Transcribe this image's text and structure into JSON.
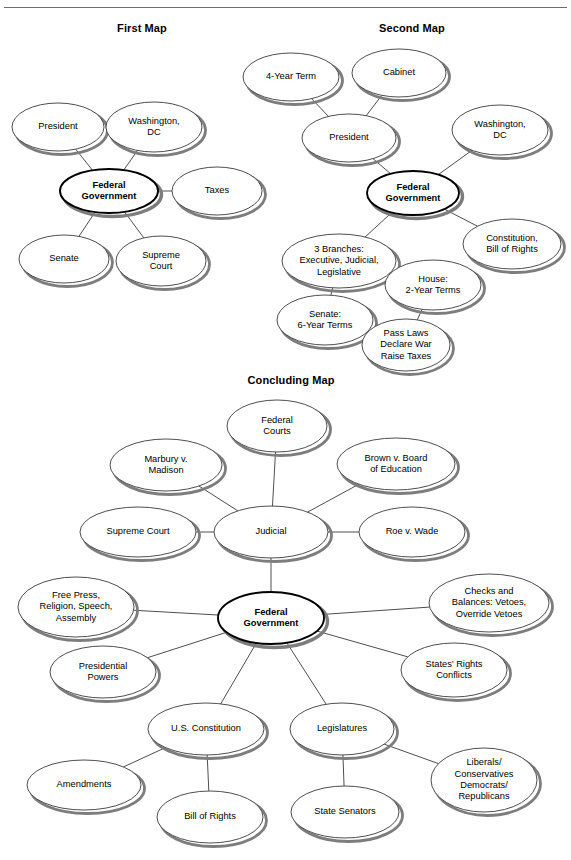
{
  "page": {
    "background": "#ffffff",
    "edge_color": "#3a3a3a",
    "node_fill": "#ffffff",
    "node_stroke": "#3a3a3a",
    "center_node_stroke": "#000000",
    "shadow_color": "#7d7d7d",
    "clipped_top_text": "",
    "titles": [
      {
        "id": "first-map-title",
        "label": "First Map",
        "x": 82,
        "y": 22,
        "w": 120
      },
      {
        "id": "second-map-title",
        "label": "Second Map",
        "x": 352,
        "y": 22,
        "w": 120
      },
      {
        "id": "concluding-map-title",
        "label": "Concluding Map",
        "x": 226,
        "y": 374,
        "w": 130
      }
    ]
  },
  "chart_data": {
    "type": "diagram",
    "maps": [
      {
        "name": "First Map",
        "nodes": [
          {
            "id": "fm-federal",
            "label": "Federal\nGovernment",
            "center": true
          },
          {
            "id": "fm-president",
            "label": "President",
            "center": false
          },
          {
            "id": "fm-washington",
            "label": "Washington,\nDC",
            "center": false
          },
          {
            "id": "fm-taxes",
            "label": "Taxes",
            "center": false
          },
          {
            "id": "fm-senate",
            "label": "Senate",
            "center": false
          },
          {
            "id": "fm-supreme",
            "label": "Supreme\nCourt",
            "center": false
          }
        ],
        "edges": [
          [
            "fm-federal",
            "fm-president"
          ],
          [
            "fm-federal",
            "fm-washington"
          ],
          [
            "fm-federal",
            "fm-taxes"
          ],
          [
            "fm-federal",
            "fm-senate"
          ],
          [
            "fm-federal",
            "fm-supreme"
          ]
        ]
      },
      {
        "name": "Second Map",
        "nodes": [
          {
            "id": "sm-federal",
            "label": "Federal\nGovernment",
            "center": true
          },
          {
            "id": "sm-president",
            "label": "President",
            "center": false
          },
          {
            "id": "sm-4year",
            "label": "4-Year Term",
            "center": false
          },
          {
            "id": "sm-cabinet",
            "label": "Cabinet",
            "center": false
          },
          {
            "id": "sm-washington",
            "label": "Washington,\nDC",
            "center": false
          },
          {
            "id": "sm-constitution",
            "label": "Constitution,\nBill of Rights",
            "center": false
          },
          {
            "id": "sm-branches",
            "label": "3 Branches:\nExecutive, Judicial,\nLegislative",
            "center": false
          },
          {
            "id": "sm-house",
            "label": "House:\n2-Year Terms",
            "center": false
          },
          {
            "id": "sm-senate",
            "label": "Senate:\n6-Year Terms",
            "center": false
          },
          {
            "id": "sm-passlaws",
            "label": "Pass Laws\nDeclare War\nRaise Taxes",
            "center": false
          }
        ],
        "edges": [
          [
            "sm-federal",
            "sm-president"
          ],
          [
            "sm-president",
            "sm-4year"
          ],
          [
            "sm-president",
            "sm-cabinet"
          ],
          [
            "sm-federal",
            "sm-washington"
          ],
          [
            "sm-federal",
            "sm-constitution"
          ],
          [
            "sm-federal",
            "sm-branches"
          ],
          [
            "sm-branches",
            "sm-house"
          ],
          [
            "sm-branches",
            "sm-senate"
          ],
          [
            "sm-house",
            "sm-passlaws"
          ],
          [
            "sm-senate",
            "sm-passlaws"
          ]
        ]
      },
      {
        "name": "Concluding Map",
        "nodes": [
          {
            "id": "cm-federal",
            "label": "Federal\nGovernment",
            "center": true
          },
          {
            "id": "cm-judicial",
            "label": "Judicial",
            "center": false
          },
          {
            "id": "cm-fedcourts",
            "label": "Federal\nCourts",
            "center": false
          },
          {
            "id": "cm-marbury",
            "label": "Marbury v.\nMadison",
            "center": false
          },
          {
            "id": "cm-brown",
            "label": "Brown v. Board\nof Education",
            "center": false
          },
          {
            "id": "cm-supreme",
            "label": "Supreme Court",
            "center": false
          },
          {
            "id": "cm-roe",
            "label": "Roe v. Wade",
            "center": false
          },
          {
            "id": "cm-freepress",
            "label": "Free Press,\nReligion, Speech,\nAssembly",
            "center": false
          },
          {
            "id": "cm-checks",
            "label": "Checks and\nBalances: Vetoes,\nOverride Vetoes",
            "center": false
          },
          {
            "id": "cm-prespowers",
            "label": "Presidential\nPowers",
            "center": false
          },
          {
            "id": "cm-states",
            "label": "States’ Rights\nConflicts",
            "center": false
          },
          {
            "id": "cm-usconst",
            "label": "U.S. Constitution",
            "center": false
          },
          {
            "id": "cm-legislatures",
            "label": "Legislatures",
            "center": false
          },
          {
            "id": "cm-amendments",
            "label": "Amendments",
            "center": false
          },
          {
            "id": "cm-billrights",
            "label": "Bill of Rights",
            "center": false
          },
          {
            "id": "cm-statesen",
            "label": "State Senators",
            "center": false
          },
          {
            "id": "cm-parties",
            "label": "Liberals/\nConservatives\nDemocrats/\nRepublicans",
            "center": false
          }
        ],
        "edges": [
          [
            "cm-federal",
            "cm-judicial"
          ],
          [
            "cm-judicial",
            "cm-fedcourts"
          ],
          [
            "cm-judicial",
            "cm-marbury"
          ],
          [
            "cm-judicial",
            "cm-brown"
          ],
          [
            "cm-judicial",
            "cm-supreme"
          ],
          [
            "cm-judicial",
            "cm-roe"
          ],
          [
            "cm-federal",
            "cm-freepress"
          ],
          [
            "cm-federal",
            "cm-checks"
          ],
          [
            "cm-federal",
            "cm-prespowers"
          ],
          [
            "cm-federal",
            "cm-states"
          ],
          [
            "cm-federal",
            "cm-usconst"
          ],
          [
            "cm-federal",
            "cm-legislatures"
          ],
          [
            "cm-usconst",
            "cm-amendments"
          ],
          [
            "cm-usconst",
            "cm-billrights"
          ],
          [
            "cm-legislatures",
            "cm-statesen"
          ],
          [
            "cm-legislatures",
            "cm-parties"
          ]
        ]
      }
    ]
  },
  "geometry": {
    "fm-president": {
      "cx": 58,
      "cy": 127,
      "rx": 46,
      "ry": 24
    },
    "fm-washington": {
      "cx": 154,
      "cy": 127,
      "rx": 48,
      "ry": 25
    },
    "fm-federal": {
      "cx": 109,
      "cy": 191,
      "rx": 49,
      "ry": 22
    },
    "fm-taxes": {
      "cx": 217,
      "cy": 191,
      "rx": 45,
      "ry": 24
    },
    "fm-senate": {
      "cx": 64,
      "cy": 259,
      "rx": 45,
      "ry": 24
    },
    "fm-supreme": {
      "cx": 161,
      "cy": 261,
      "rx": 45,
      "ry": 25
    },
    "sm-4year": {
      "cx": 291,
      "cy": 77,
      "rx": 48,
      "ry": 24
    },
    "sm-cabinet": {
      "cx": 399,
      "cy": 73,
      "rx": 47,
      "ry": 24
    },
    "sm-president": {
      "cx": 349,
      "cy": 138,
      "rx": 47,
      "ry": 24
    },
    "sm-washington": {
      "cx": 500,
      "cy": 130,
      "rx": 48,
      "ry": 25
    },
    "sm-federal": {
      "cx": 413,
      "cy": 193,
      "rx": 46,
      "ry": 22
    },
    "sm-constitution": {
      "cx": 512,
      "cy": 244,
      "rx": 49,
      "ry": 25
    },
    "sm-branches": {
      "cx": 339,
      "cy": 261,
      "rx": 57,
      "ry": 27
    },
    "sm-house": {
      "cx": 433,
      "cy": 285,
      "rx": 48,
      "ry": 25
    },
    "sm-senate": {
      "cx": 325,
      "cy": 320,
      "rx": 48,
      "ry": 25
    },
    "sm-passlaws": {
      "cx": 406,
      "cy": 345,
      "rx": 44,
      "ry": 26
    },
    "cm-fedcourts": {
      "cx": 277,
      "cy": 426,
      "rx": 50,
      "ry": 26
    },
    "cm-marbury": {
      "cx": 166,
      "cy": 465,
      "rx": 56,
      "ry": 26
    },
    "cm-brown": {
      "cx": 396,
      "cy": 464,
      "rx": 59,
      "ry": 26
    },
    "cm-supreme": {
      "cx": 138,
      "cy": 532,
      "rx": 58,
      "ry": 25
    },
    "cm-judicial": {
      "cx": 271,
      "cy": 532,
      "rx": 57,
      "ry": 26
    },
    "cm-roe": {
      "cx": 412,
      "cy": 532,
      "rx": 53,
      "ry": 25
    },
    "cm-freepress": {
      "cx": 76,
      "cy": 607,
      "rx": 58,
      "ry": 30
    },
    "cm-federal": {
      "cx": 271,
      "cy": 618,
      "rx": 53,
      "ry": 26
    },
    "cm-checks": {
      "cx": 489,
      "cy": 603,
      "rx": 60,
      "ry": 29
    },
    "cm-prespowers": {
      "cx": 103,
      "cy": 672,
      "rx": 53,
      "ry": 26
    },
    "cm-states": {
      "cx": 454,
      "cy": 670,
      "rx": 53,
      "ry": 27
    },
    "cm-usconst": {
      "cx": 206,
      "cy": 729,
      "rx": 58,
      "ry": 26
    },
    "cm-legislatures": {
      "cx": 342,
      "cy": 729,
      "rx": 52,
      "ry": 26
    },
    "cm-amendments": {
      "cx": 84,
      "cy": 785,
      "rx": 57,
      "ry": 25
    },
    "cm-billrights": {
      "cx": 210,
      "cy": 817,
      "rx": 53,
      "ry": 26
    },
    "cm-statesen": {
      "cx": 345,
      "cy": 812,
      "rx": 54,
      "ry": 26
    },
    "cm-parties": {
      "cx": 484,
      "cy": 780,
      "rx": 53,
      "ry": 32
    }
  }
}
